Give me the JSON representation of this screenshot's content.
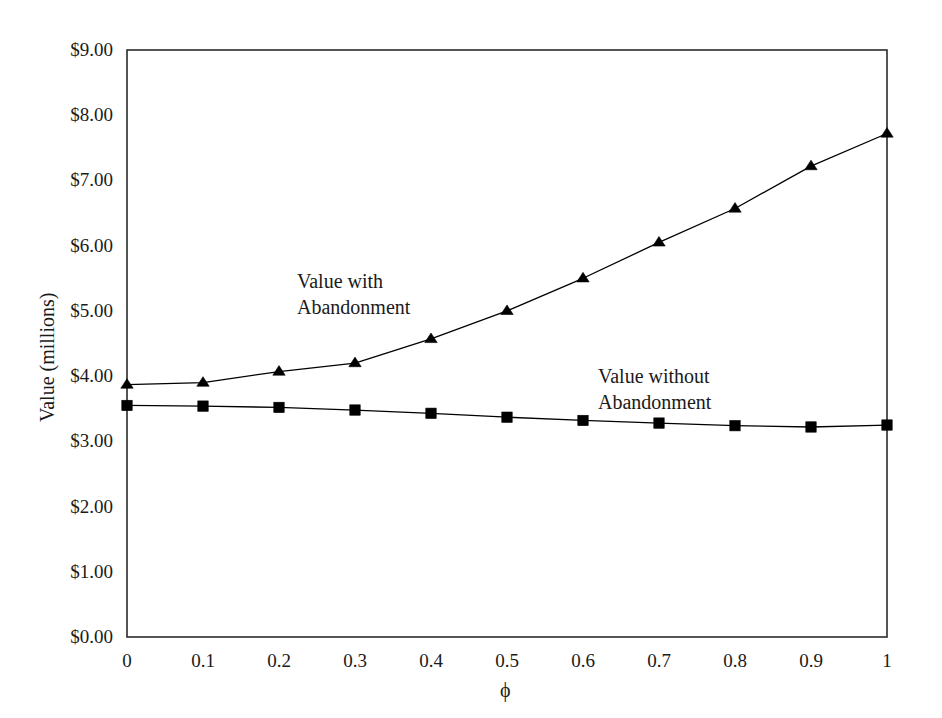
{
  "chart_data": {
    "type": "line",
    "title": "",
    "subtitle": "",
    "xlabel": "ϕ",
    "ylabel": "Value (millions)",
    "x": [
      0,
      0.1,
      0.2,
      0.3,
      0.4,
      0.5,
      0.6,
      0.7,
      0.8,
      0.9,
      1
    ],
    "xtick_labels": [
      "0",
      "0.1",
      "0.2",
      "0.3",
      "0.4",
      "0.5",
      "0.6",
      "0.7",
      "0.8",
      "0.9",
      "1"
    ],
    "ytick_labels": [
      "$0.00",
      "$1.00",
      "$2.00",
      "$3.00",
      "$4.00",
      "$5.00",
      "$6.00",
      "$7.00",
      "$8.00",
      "$9.00"
    ],
    "ytick_values": [
      0,
      1,
      2,
      3,
      4,
      5,
      6,
      7,
      8,
      9
    ],
    "xlim": [
      0,
      1
    ],
    "ylim": [
      0,
      9
    ],
    "grid": false,
    "legend_position": "inline-annotation",
    "series": [
      {
        "name": "Value with Abandonment",
        "marker": "triangle",
        "color": "#000000",
        "values": [
          3.87,
          3.9,
          4.07,
          4.2,
          4.57,
          5.0,
          5.5,
          6.05,
          6.57,
          7.22,
          7.72
        ]
      },
      {
        "name": "Value without Abandonment",
        "marker": "square",
        "color": "#000000",
        "values": [
          3.55,
          3.54,
          3.52,
          3.48,
          3.43,
          3.37,
          3.32,
          3.28,
          3.24,
          3.22,
          3.25
        ]
      }
    ],
    "annotations": [
      {
        "id": "with-abandonment",
        "line1": "Value with",
        "line2": "Abandonment",
        "x_px": 297,
        "y_px": 268
      },
      {
        "id": "without-abandonment",
        "line1": "Value without",
        "line2": "Abandonment",
        "x_px": 598,
        "y_px": 363
      }
    ],
    "plot_area": {
      "left": 127,
      "top": 50,
      "right": 887,
      "bottom": 637
    },
    "frame_color": "#2b2b2b",
    "background": "#ffffff"
  }
}
